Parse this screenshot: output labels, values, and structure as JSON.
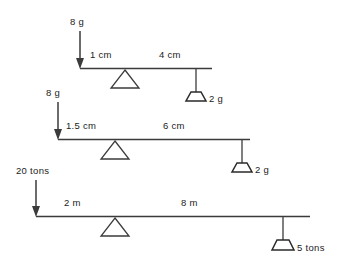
{
  "figure": {
    "type": "physics-lever-diagram",
    "background_color": "#ffffff",
    "line_color": "#3b3b3b",
    "text_color": "#1c1c1c"
  },
  "levers": [
    {
      "id": "lever-1",
      "effort_label": "8 g",
      "effort_arm_label": "1 cm",
      "resistance_arm_label": "4 cm",
      "load_label": "2 g",
      "fulcrum_icon": "triangle-fulcrum-icon",
      "load_icon": "trapezoid-weight-icon",
      "effort_icon": "down-arrow-icon"
    },
    {
      "id": "lever-2",
      "effort_label": "8 g",
      "effort_arm_label": "1.5 cm",
      "resistance_arm_label": "6 cm",
      "load_label": "2 g",
      "fulcrum_icon": "triangle-fulcrum-icon",
      "load_icon": "trapezoid-weight-icon",
      "effort_icon": "down-arrow-icon"
    },
    {
      "id": "lever-3",
      "effort_label": "20 tons",
      "effort_arm_label": "2 m",
      "resistance_arm_label": "8 m",
      "load_label": "5 tons",
      "fulcrum_icon": "triangle-fulcrum-icon",
      "load_icon": "trapezoid-weight-icon",
      "effort_icon": "down-arrow-icon"
    }
  ]
}
